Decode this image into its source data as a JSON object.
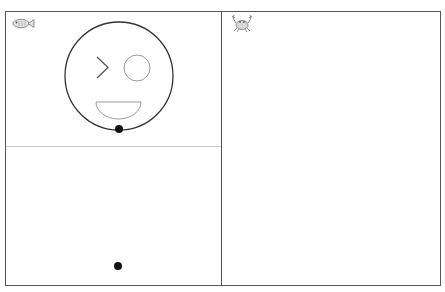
{
  "panels": [
    {
      "id": "top-left",
      "sprite": "fish-icon"
    },
    {
      "id": "bottom-left",
      "sprite": null
    },
    {
      "id": "right",
      "sprite": "crab-icon"
    }
  ],
  "face": {
    "outline": {
      "cx": 119,
      "cy": 76,
      "r": 54
    },
    "left_eye": "chevron",
    "right_eye": {
      "cx": 137,
      "cy": 68,
      "r": 13
    },
    "mouth": "half-circle"
  },
  "points": [
    {
      "name": "face-bottom-dot",
      "x": 119,
      "y": 129
    },
    {
      "name": "lower-panel-dot",
      "x": 118,
      "y": 266
    }
  ],
  "colors": {
    "border": "#555555",
    "divider": "#c8c8c8",
    "face_outline": "#333333",
    "feature_stroke": "#888888",
    "dot": "#111111"
  }
}
